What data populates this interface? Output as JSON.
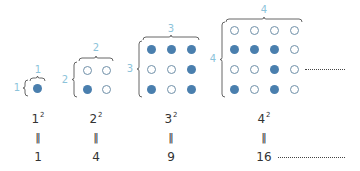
{
  "colors": {
    "filled": "#4a7fae",
    "open_outline": "#6f8fa8",
    "label": "#8cc3da",
    "text": "#333333"
  },
  "figures": [
    {
      "n": "1",
      "top_label": "1",
      "side_label": "1",
      "grid": [
        [
          "F"
        ]
      ],
      "cx": [
        37
      ],
      "cy": [
        88
      ],
      "top_label_pos": [
        38,
        70
      ],
      "side_label_pos": [
        17,
        88
      ],
      "hbrace": [
        30,
        45,
        78
      ],
      "vbrace": [
        25,
        80,
        96
      ]
    },
    {
      "n": "2",
      "top_label": "2",
      "side_label": "2",
      "grid": [
        [
          "O",
          "O"
        ],
        [
          "F",
          "O"
        ]
      ],
      "cx": [
        87,
        106
      ],
      "cy": [
        70,
        89
      ],
      "top_label_pos": [
        96,
        48
      ],
      "side_label_pos": [
        65,
        80
      ],
      "hbrace": [
        79,
        113,
        58
      ],
      "vbrace": [
        74,
        62,
        97
      ]
    },
    {
      "n": "3",
      "top_label": "3",
      "side_label": "3",
      "grid": [
        [
          "F",
          "F",
          "F"
        ],
        [
          "O",
          "O",
          "F"
        ],
        [
          "F",
          "O",
          "F"
        ]
      ],
      "cx": [
        151,
        171,
        191
      ],
      "cy": [
        49,
        69,
        89
      ],
      "top_label_pos": [
        171,
        29
      ],
      "side_label_pos": [
        130,
        69
      ],
      "hbrace": [
        143,
        199,
        37
      ],
      "vbrace": [
        139,
        41,
        97
      ]
    },
    {
      "n": "4",
      "top_label": "4",
      "side_label": "4",
      "grid": [
        [
          "O",
          "O",
          "O",
          "O"
        ],
        [
          "F",
          "F",
          "F",
          "O"
        ],
        [
          "O",
          "O",
          "F",
          "O"
        ],
        [
          "F",
          "O",
          "F",
          "O"
        ]
      ],
      "cx": [
        234,
        254,
        274,
        294
      ],
      "cy": [
        30,
        49,
        69,
        89
      ],
      "top_label_pos": [
        264,
        10
      ],
      "side_label_pos": [
        213,
        59
      ],
      "hbrace": [
        226,
        302,
        19
      ],
      "vbrace": [
        222,
        22,
        97
      ]
    }
  ],
  "equations": [
    {
      "base": "1",
      "exp": "2",
      "eq": "‖",
      "value": "1",
      "x": 38
    },
    {
      "base": "2",
      "exp": "2",
      "eq": "‖",
      "value": "4",
      "x": 96
    },
    {
      "base": "3",
      "exp": "2",
      "eq": "‖",
      "value": "9",
      "x": 171
    },
    {
      "base": "4",
      "exp": "2",
      "eq": "‖",
      "value": "16",
      "x": 264
    }
  ],
  "continuation": {
    "figure_dots": {
      "x1": 305,
      "x2": 345,
      "y": 69
    },
    "sequence_dots": {
      "x1": 278,
      "x2": 345,
      "y": 157
    }
  },
  "rows_y": {
    "power": 118,
    "equals": 137,
    "value": 157
  }
}
